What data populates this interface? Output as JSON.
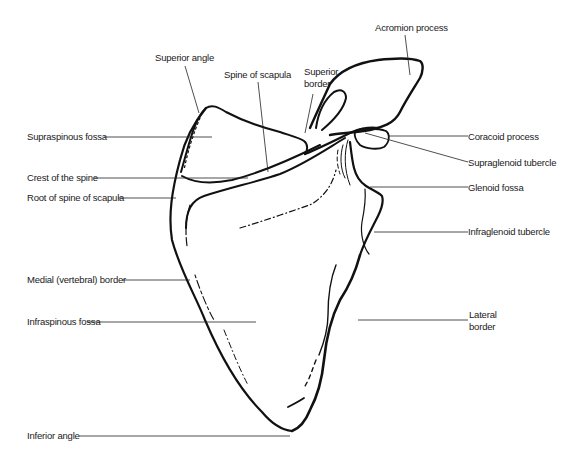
{
  "figure": {
    "line_color": "#111111",
    "leader_color": "#222222",
    "background": "#ffffff"
  },
  "labels": {
    "acromion_process": "Acromion process",
    "superior_angle": "Superior angle",
    "spine_of_scapula": "Spine of scapula",
    "superior_border_line1": "Superior",
    "superior_border_line2": "border",
    "supraspinous_fossa": "Supraspinous fossa",
    "coracoid_process": "Coracoid process",
    "supraglenoid_tubercle": "Supraglenoid tubercle",
    "crest_of_the_spine": "Crest of the spine",
    "root_of_spine": "Root of spine of scapula",
    "glenoid_fossa": "Glenoid fossa",
    "infraglenoid_tubercle": "Infraglenoid tubercle",
    "medial_border": "Medial (vertebral) border",
    "infraspinous_fossa": "Infraspinous fossa",
    "lateral_border_line1": "Lateral",
    "lateral_border_line2": "border",
    "inferior_angle": "Inferior angle"
  }
}
